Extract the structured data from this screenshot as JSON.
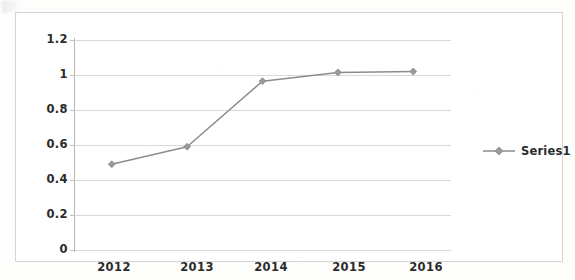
{
  "chart_data": {
    "type": "line",
    "title": "",
    "subtitle": "",
    "xlabel": "",
    "ylabel": "",
    "categories": [
      "2012",
      "2013",
      "2014",
      "2015",
      "2016"
    ],
    "series": [
      {
        "name": "Series1",
        "values": [
          0.49,
          0.59,
          0.965,
          1.015,
          1.02
        ],
        "color": "#8c8c8c",
        "marker": "diamond"
      }
    ],
    "ylim": [
      0,
      1.2
    ],
    "ytick_labels": [
      "0",
      "0.2",
      "0.4",
      "0.6",
      "0.8",
      "1",
      "1.2"
    ],
    "ytick_values": [
      0,
      0.2,
      0.4,
      0.6,
      0.8,
      1,
      1.2
    ],
    "grid": true,
    "grid_axis": "y",
    "grid_color": "#d9d9d9",
    "legend": {
      "position": "right",
      "entries": [
        "Series1"
      ]
    },
    "axis_label_color": "#2b2b2b",
    "plot_background": "#ffffff",
    "frame_color": "#d4d4d4"
  },
  "legend": {
    "series1_label": "Series1"
  }
}
